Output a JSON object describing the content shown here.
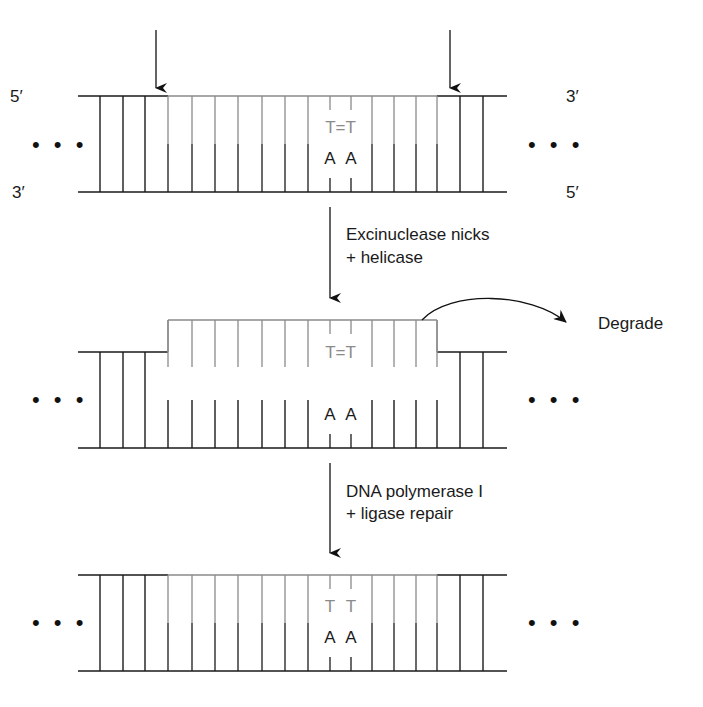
{
  "colors": {
    "old_strand": "#1a1a1a",
    "new_or_damaged_strand": "#8a8a8a",
    "background": "#ffffff"
  },
  "labels": {
    "top_left_end": "5′",
    "bottom_left_end": "3′",
    "top_right_end": "3′",
    "bottom_right_end": "5′",
    "ellipsis": "• • •",
    "step1": [
      "Excinuclease nicks",
      "+ helicase"
    ],
    "step2": [
      "DNA polymerase I",
      "+ ligase repair"
    ],
    "degrade": "Degrade"
  },
  "geometry": {
    "x_start": 78,
    "x_end": 507,
    "damaged_region": [
      168,
      437
    ],
    "rung_x": [
      100,
      123,
      145,
      168,
      192,
      215,
      238,
      262,
      285,
      308,
      330,
      351,
      372,
      394,
      416,
      437,
      460,
      483
    ],
    "dimer_x": [
      330,
      351
    ],
    "nick_arrows_x": [
      156,
      450
    ]
  },
  "panels": [
    {
      "id": "damaged",
      "top_y": 96,
      "bottom_y": 192,
      "top_bases": "T=T",
      "bottom_bases": [
        "A",
        "A"
      ]
    },
    {
      "id": "excised",
      "fragment_y": 320,
      "top_y": 352,
      "bottom_y": 448,
      "top_bases": "T=T",
      "bottom_bases": [
        "A",
        "A"
      ]
    },
    {
      "id": "repaired",
      "top_y": 575,
      "bottom_y": 671,
      "top_bases": [
        "T",
        "T"
      ],
      "bottom_bases": [
        "A",
        "A"
      ]
    }
  ]
}
